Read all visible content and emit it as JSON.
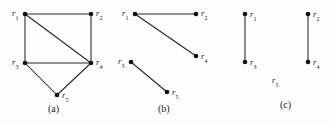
{
  "figure": {
    "background_color": "#fdfdfd",
    "stroke_color": "#262626",
    "vertex_color": "#111111",
    "text_color": "#1a1a1a"
  },
  "panels": [
    {
      "id": "a",
      "caption": "(a)",
      "caption_x": 48,
      "caption_y": 104,
      "origin_x": 0,
      "width": 115,
      "vertices": [
        {
          "id": "r1",
          "label": "r",
          "sub": "1",
          "x": 25,
          "y": 14,
          "label_x": 12,
          "label_y": 9
        },
        {
          "id": "r2",
          "label": "r",
          "sub": "2",
          "x": 91,
          "y": 14,
          "label_x": 96,
          "label_y": 9
        },
        {
          "id": "r3",
          "label": "r",
          "sub": "3",
          "x": 25,
          "y": 63,
          "label_x": 12,
          "label_y": 58
        },
        {
          "id": "r4",
          "label": "r",
          "sub": "4",
          "x": 91,
          "y": 63,
          "label_x": 96,
          "label_y": 58
        },
        {
          "id": "r5",
          "label": "r",
          "sub": "5",
          "x": 57,
          "y": 95,
          "label_x": 62,
          "label_y": 91
        }
      ],
      "edges": [
        {
          "from": "r1",
          "to": "r2"
        },
        {
          "from": "r1",
          "to": "r3"
        },
        {
          "from": "r1",
          "to": "r4"
        },
        {
          "from": "r2",
          "to": "r4"
        },
        {
          "from": "r3",
          "to": "r4"
        },
        {
          "from": "r3",
          "to": "r5"
        },
        {
          "from": "r4",
          "to": "r5"
        }
      ]
    },
    {
      "id": "b",
      "caption": "(b)",
      "caption_x": 48,
      "caption_y": 104,
      "origin_x": 110,
      "width": 110,
      "vertices": [
        {
          "id": "r1",
          "label": "r",
          "sub": "1",
          "x": 25,
          "y": 14,
          "label_x": 12,
          "label_y": 9
        },
        {
          "id": "r2",
          "label": "r",
          "sub": "2",
          "x": 86,
          "y": 14,
          "label_x": 91,
          "label_y": 9
        },
        {
          "id": "r3",
          "label": "r",
          "sub": "3",
          "x": 21,
          "y": 62,
          "label_x": 8,
          "label_y": 57
        },
        {
          "id": "r4",
          "label": "r",
          "sub": "4",
          "x": 86,
          "y": 56,
          "label_x": 91,
          "label_y": 52
        },
        {
          "id": "r5",
          "label": "r",
          "sub": "5",
          "x": 57,
          "y": 92,
          "label_x": 62,
          "label_y": 88
        }
      ],
      "edges": [
        {
          "from": "r1",
          "to": "r2"
        },
        {
          "from": "r1",
          "to": "r4"
        },
        {
          "from": "r3",
          "to": "r5"
        }
      ]
    },
    {
      "id": "c",
      "caption": "(c)",
      "caption_x": 62,
      "caption_y": 100,
      "origin_x": 218,
      "width": 117,
      "vertices": [
        {
          "id": "r1",
          "label": "r",
          "sub": "1",
          "x": 27,
          "y": 14,
          "label_x": 32,
          "label_y": 10
        },
        {
          "id": "r3",
          "label": "r",
          "sub": "3",
          "x": 27,
          "y": 62,
          "label_x": 32,
          "label_y": 58
        },
        {
          "id": "r2",
          "label": "r",
          "sub": "2",
          "x": 90,
          "y": 14,
          "label_x": 95,
          "label_y": 10
        },
        {
          "id": "r4",
          "label": "r",
          "sub": "4",
          "x": 90,
          "y": 62,
          "label_x": 95,
          "label_y": 58
        }
      ],
      "isolated_labels": [
        {
          "id": "r5",
          "label": "r",
          "sub": "5",
          "label_x": 54,
          "label_y": 76
        }
      ],
      "edges": [
        {
          "from": "r1",
          "to": "r3"
        },
        {
          "from": "r2",
          "to": "r4"
        }
      ]
    }
  ]
}
